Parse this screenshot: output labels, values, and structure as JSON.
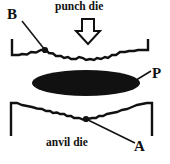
{
  "figure": {
    "background_color": "#ffffff",
    "ink_color": "#111111",
    "width": 170,
    "height": 164
  },
  "captions": {
    "punch_die": "punch die",
    "anvil_die": "anvil die"
  },
  "labels": {
    "B": "B",
    "P": "P",
    "A": "A"
  },
  "annotations": [
    {
      "id": "B",
      "text": "B",
      "target": "contact point on upper punch die surface",
      "leader_from": [
        21,
        20
      ],
      "leader_to": [
        45,
        50
      ],
      "dot": [
        45,
        50
      ]
    },
    {
      "id": "P",
      "text": "P",
      "target": "compressed particle (solid black ellipse)",
      "leader_from": [
        151,
        71
      ],
      "leader_to": [
        128,
        84
      ],
      "dot": null
    },
    {
      "id": "A",
      "text": "A",
      "target": "contact point on lower anvil die surface",
      "leader_from": [
        136,
        143
      ],
      "leader_to": [
        86,
        119
      ],
      "dot": [
        86,
        119
      ]
    }
  ],
  "elements": {
    "punch_arrow": {
      "name": "down-arrow-icon",
      "direction": "down",
      "fill": "#ffffff",
      "stroke": "#111111"
    },
    "particle": {
      "name": "particle-ellipse",
      "shape": "ellipse",
      "fill": "#111111",
      "center": [
        86,
        83
      ],
      "radius_x": 54,
      "radius_y": 13
    },
    "upper_die": {
      "name": "punch-die-body",
      "surface": "irregular rough contour facing downward"
    },
    "lower_die": {
      "name": "anvil-die-body",
      "surface": "irregular rough contour facing upward"
    }
  }
}
